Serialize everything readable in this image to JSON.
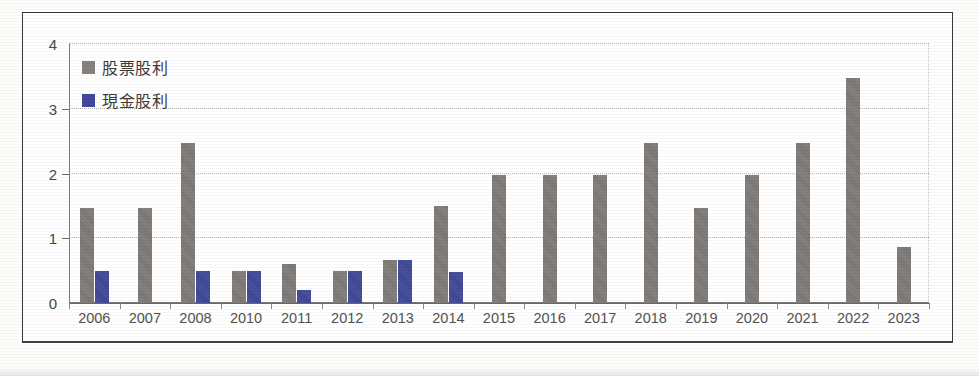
{
  "chart_data": {
    "type": "bar",
    "title": "",
    "subtitle": "",
    "xlabel": "",
    "ylabel": "",
    "ylim": [
      0,
      4
    ],
    "yticks": [
      0,
      1,
      2,
      3,
      4
    ],
    "grid": true,
    "grid_style": "dotted-horizontal",
    "legend_position": "top-left-inside",
    "categories": [
      "2006",
      "2007",
      "2008",
      "2010",
      "2011",
      "2012",
      "2013",
      "2014",
      "2015",
      "2016",
      "2017",
      "2018",
      "2019",
      "2020",
      "2021",
      "2022",
      "2023"
    ],
    "series": [
      {
        "name": "股票股利",
        "color": "#7e7b78",
        "values": [
          1.47,
          1.47,
          2.47,
          0.5,
          0.6,
          0.5,
          0.67,
          1.5,
          1.98,
          1.98,
          1.98,
          2.47,
          1.47,
          1.97,
          2.47,
          3.47,
          0.87
        ]
      },
      {
        "name": "現金股利",
        "color": "#41499b",
        "values": [
          0.5,
          0,
          0.5,
          0.5,
          0.2,
          0.5,
          0.66,
          0.48,
          0,
          0,
          0,
          0,
          0,
          0,
          0,
          0,
          0
        ]
      }
    ]
  },
  "legend": {
    "items": [
      {
        "label": "股票股利",
        "swatch": "stock-swatch",
        "color": "#7e7b78"
      },
      {
        "label": "現金股利",
        "swatch": "cash-swatch",
        "color": "#41499b"
      }
    ]
  },
  "axes": {
    "y_tick_labels": [
      "4",
      "3",
      "2",
      "1",
      "0"
    ],
    "x_tick_labels": [
      "2006",
      "2007",
      "2008",
      "2010",
      "2011",
      "2012",
      "2013",
      "2014",
      "2015",
      "2016",
      "2017",
      "2018",
      "2019",
      "2020",
      "2021",
      "2022",
      "2023"
    ]
  },
  "colors": {
    "stock_dividend": "#7e7b78",
    "cash_dividend": "#41499b",
    "frame": "#3a3636",
    "axis": "#6f6c68",
    "gridline": "#b9b7b4",
    "text": "#4a4745",
    "background": "#ffffff"
  }
}
